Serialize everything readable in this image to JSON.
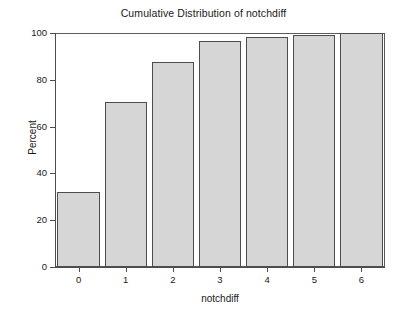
{
  "chart_data": {
    "type": "bar",
    "title": "Cumulative Distribution of notchdiff",
    "xlabel": "notchdiff",
    "ylabel": "Percent",
    "categories": [
      "0",
      "1",
      "2",
      "3",
      "4",
      "5",
      "6"
    ],
    "values": [
      32,
      70.5,
      87.7,
      96.6,
      98.4,
      99.3,
      100
    ],
    "ylim": [
      0,
      100
    ],
    "yticks": [
      0,
      20,
      40,
      60,
      80,
      100
    ],
    "ytick_labels": [
      "0",
      "20",
      "40",
      "60",
      "80",
      "100"
    ],
    "xtick_labels": [
      "0",
      "1",
      "2",
      "3",
      "4",
      "5",
      "6"
    ],
    "grid": false,
    "legend": null,
    "bar_fill_color": "#d6d6d6",
    "bar_edge_color": "#4d4d4d",
    "axis_color": "#4d4d4d",
    "background_color": "#ffffff"
  }
}
